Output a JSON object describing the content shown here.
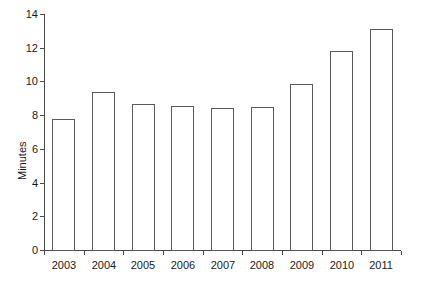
{
  "chart_data": {
    "type": "bar",
    "title": "",
    "subtitle": "",
    "xlabel": "",
    "ylabel": "Minutes",
    "categories": [
      "2003",
      "2004",
      "2005",
      "2006",
      "2007",
      "2008",
      "2009",
      "2010",
      "2011"
    ],
    "values": [
      7.8,
      9.4,
      8.65,
      8.55,
      8.4,
      8.5,
      9.85,
      11.8,
      13.1
    ],
    "ylim": [
      0,
      14
    ],
    "ytick_labels": [
      "0",
      "2",
      "4",
      "6",
      "8",
      "10",
      "12",
      "14"
    ],
    "ytick_values": [
      0,
      2,
      4,
      6,
      8,
      10,
      12,
      14
    ],
    "grid": false,
    "legend": null,
    "legend_position": "none",
    "annotations": [],
    "colors": {
      "bar_fill": "#ffffff",
      "bar_stroke": "#5a5a5a",
      "axis": "#4a4a4a",
      "text": "#1a1a1a",
      "background": "#ffffff"
    }
  }
}
